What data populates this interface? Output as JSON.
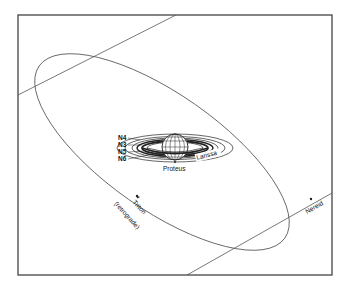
{
  "diagram": {
    "title": "",
    "colors": {
      "line": "#555555",
      "frame": "#444444",
      "ring": "#222222",
      "text": "#111111",
      "background": "#ffffff"
    },
    "inner_labels": {
      "n4": "N4",
      "n3": "N3",
      "n5": "N5",
      "n6": "N6",
      "larissa": "Larissa",
      "proteus": "Proteus"
    },
    "outer_labels": {
      "triton": "Triton",
      "triton_note": "(retrograde)",
      "nereid": "Nereid"
    },
    "nodes": [
      {
        "name": "Neptune",
        "type": "planet"
      },
      {
        "name": "N4",
        "type": "orbit"
      },
      {
        "name": "N3",
        "type": "orbit"
      },
      {
        "name": "N5",
        "type": "orbit"
      },
      {
        "name": "N6",
        "type": "orbit"
      },
      {
        "name": "Larissa",
        "type": "orbit"
      },
      {
        "name": "Proteus",
        "type": "orbit"
      },
      {
        "name": "Triton",
        "type": "orbit",
        "note": "retrograde"
      },
      {
        "name": "Nereid",
        "type": "orbit"
      }
    ]
  }
}
